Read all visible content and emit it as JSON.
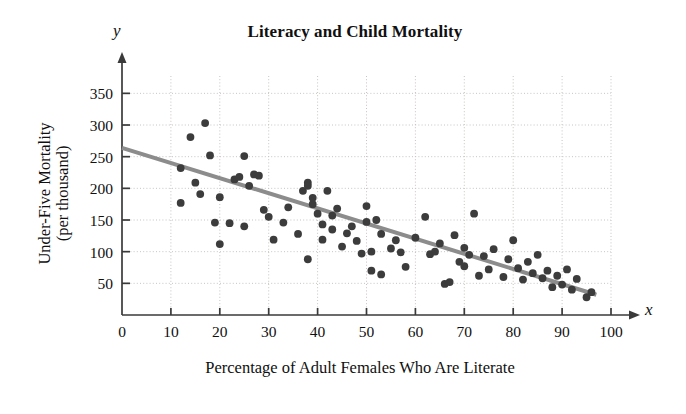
{
  "chart_data": {
    "type": "scatter",
    "title": "Literacy and Child Mortality",
    "xlabel": "Percentage of Adult Females Who Are Literate",
    "ylabel": "Under-Five Mortality\n(per thousand)",
    "x_axis_variable": "x",
    "y_axis_variable": "y",
    "xlim": [
      0,
      100
    ],
    "ylim": [
      0,
      370
    ],
    "xticks": [
      0,
      10,
      20,
      30,
      40,
      50,
      60,
      70,
      80,
      90,
      100
    ],
    "yticks": [
      50,
      100,
      150,
      200,
      250,
      300,
      350
    ],
    "grid": true,
    "grid_style": "dotted",
    "legend": "none",
    "marker_color": "#3c3c3c",
    "line_color": "#8c8c8c",
    "axis_color": "#3a3a3a",
    "grid_color": "#c8c4c0",
    "trend_line": {
      "label": "least-squares regression line",
      "x_start": 0,
      "y_start": 264,
      "x_end": 97,
      "y_end": 32,
      "slope": -2.39,
      "intercept": 264
    },
    "points": [
      [
        12,
        232
      ],
      [
        12,
        177
      ],
      [
        14,
        281
      ],
      [
        15,
        209
      ],
      [
        16,
        191
      ],
      [
        17,
        303
      ],
      [
        18,
        252
      ],
      [
        19,
        146
      ],
      [
        20,
        112
      ],
      [
        20,
        186
      ],
      [
        22,
        145
      ],
      [
        23,
        214
      ],
      [
        24,
        218
      ],
      [
        25,
        251
      ],
      [
        25,
        140
      ],
      [
        26,
        204
      ],
      [
        27,
        222
      ],
      [
        28,
        220
      ],
      [
        29,
        166
      ],
      [
        30,
        155
      ],
      [
        31,
        119
      ],
      [
        33,
        146
      ],
      [
        34,
        170
      ],
      [
        36,
        128
      ],
      [
        37,
        196
      ],
      [
        38,
        209
      ],
      [
        38,
        204
      ],
      [
        38,
        88
      ],
      [
        39,
        175
      ],
      [
        39,
        185
      ],
      [
        40,
        160
      ],
      [
        41,
        143
      ],
      [
        41,
        119
      ],
      [
        42,
        196
      ],
      [
        43,
        157
      ],
      [
        43,
        135
      ],
      [
        44,
        168
      ],
      [
        45,
        108
      ],
      [
        46,
        129
      ],
      [
        47,
        140
      ],
      [
        48,
        117
      ],
      [
        49,
        97
      ],
      [
        50,
        172
      ],
      [
        50,
        147
      ],
      [
        51,
        100
      ],
      [
        51,
        70
      ],
      [
        52,
        150
      ],
      [
        53,
        128
      ],
      [
        53,
        64
      ],
      [
        55,
        105
      ],
      [
        56,
        118
      ],
      [
        57,
        99
      ],
      [
        58,
        76
      ],
      [
        60,
        122
      ],
      [
        62,
        155
      ],
      [
        63,
        96
      ],
      [
        64,
        100
      ],
      [
        65,
        113
      ],
      [
        66,
        49
      ],
      [
        67,
        52
      ],
      [
        68,
        126
      ],
      [
        69,
        84
      ],
      [
        70,
        106
      ],
      [
        70,
        77
      ],
      [
        71,
        95
      ],
      [
        72,
        160
      ],
      [
        73,
        62
      ],
      [
        74,
        93
      ],
      [
        75,
        72
      ],
      [
        76,
        104
      ],
      [
        78,
        60
      ],
      [
        79,
        88
      ],
      [
        80,
        118
      ],
      [
        81,
        74
      ],
      [
        82,
        56
      ],
      [
        83,
        84
      ],
      [
        84,
        66
      ],
      [
        85,
        95
      ],
      [
        86,
        58
      ],
      [
        87,
        70
      ],
      [
        88,
        44
      ],
      [
        89,
        62
      ],
      [
        90,
        48
      ],
      [
        91,
        72
      ],
      [
        92,
        40
      ],
      [
        93,
        57
      ],
      [
        95,
        28
      ],
      [
        96,
        36
      ]
    ]
  }
}
